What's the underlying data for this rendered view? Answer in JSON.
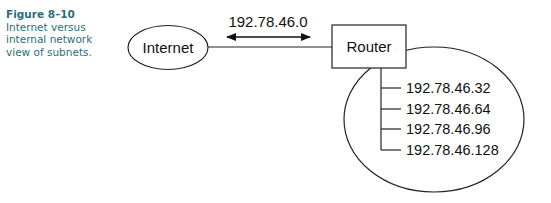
{
  "caption": {
    "figure_label": "Figure 8–10",
    "text": "Internet versus internal network view of subnets.",
    "color": "#2a6f7a"
  },
  "diagram": {
    "internet_node": {
      "label": "Internet",
      "shape": "ellipse"
    },
    "link": {
      "label": "192.78.46.0",
      "arrow": "double-headed"
    },
    "router_node": {
      "label": "Router",
      "shape": "rectangle"
    },
    "internal_network": {
      "shape": "ellipse",
      "subnets": [
        "192.78.46.32",
        "192.78.46.64",
        "192.78.46.96",
        "192.78.46.128"
      ]
    }
  }
}
